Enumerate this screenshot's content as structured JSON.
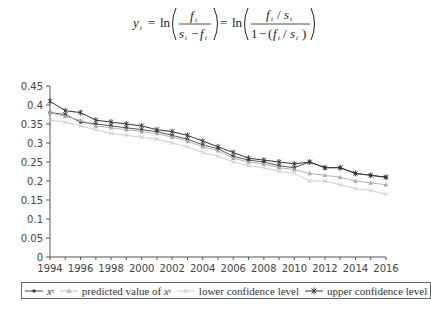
{
  "formula": {
    "lhs": "y",
    "lhs_sub": "t",
    "eq1_num": "f",
    "eq1_den_a": "s",
    "eq1_den_b": "f",
    "eq2_num_a": "f",
    "eq2_num_b": "s",
    "eq2_den_one": "1",
    "sub": "t",
    "ln": "ln",
    "text": "y_t = ln( f_t / (s_t − f_t) ) = ln( (f_t / s_t) / (1 − (f_t / s_t)) )"
  },
  "legend": {
    "items": [
      {
        "label": "x",
        "sub": "t",
        "italic": true
      },
      {
        "label": "predicted value of ",
        "var": "x",
        "sub": "t"
      },
      {
        "label": "lower confidence level"
      },
      {
        "label": "upper confidence level"
      }
    ]
  },
  "chart_data": {
    "type": "line",
    "title": "",
    "xlabel": "",
    "ylabel": "",
    "x": [
      1994,
      1995,
      1996,
      1997,
      1998,
      1999,
      2000,
      2001,
      2002,
      2003,
      2004,
      2005,
      2006,
      2007,
      2008,
      2009,
      2010,
      2011,
      2012,
      2013,
      2014,
      2015,
      2016
    ],
    "x_ticks": [
      "1994",
      "1996",
      "1998",
      "2000",
      "2002",
      "2004",
      "2006",
      "2008",
      "2010",
      "2012",
      "2014",
      "2016"
    ],
    "y_ticks": [
      "0",
      "0.05",
      "0.1",
      "0.15",
      "0.2",
      "0.25",
      "0.3",
      "0.35",
      "0.4",
      "0.45"
    ],
    "ylim": [
      0,
      0.45
    ],
    "xlim": [
      1994,
      2016
    ],
    "grid": false,
    "legend_position": "bottom",
    "series": [
      {
        "name": "x_t",
        "color": "#444444",
        "marker": "dot",
        "values": [
          0.38,
          0.375,
          0.355,
          0.35,
          0.345,
          0.34,
          0.335,
          0.33,
          0.32,
          0.31,
          0.295,
          0.285,
          0.265,
          0.255,
          0.25,
          0.24,
          0.235,
          0.25,
          0.235,
          0.235,
          0.22,
          0.215,
          0.21
        ]
      },
      {
        "name": "predicted value of x_t",
        "color": "#aaaaaa",
        "marker": "triangle",
        "values": [
          0.38,
          0.37,
          0.36,
          0.345,
          0.34,
          0.335,
          0.33,
          0.325,
          0.315,
          0.305,
          0.29,
          0.28,
          0.26,
          0.25,
          0.245,
          0.235,
          0.23,
          0.22,
          0.215,
          0.21,
          0.2,
          0.195,
          0.19
        ]
      },
      {
        "name": "lower confidence level",
        "color": "#c8c8c8",
        "marker": "cross",
        "values": [
          0.36,
          0.355,
          0.345,
          0.335,
          0.325,
          0.32,
          0.315,
          0.31,
          0.3,
          0.29,
          0.275,
          0.265,
          0.25,
          0.24,
          0.235,
          0.225,
          0.22,
          0.2,
          0.2,
          0.19,
          0.18,
          0.175,
          0.165
        ]
      },
      {
        "name": "upper confidence level",
        "color": "#333333",
        "marker": "star",
        "values": [
          0.41,
          0.385,
          0.38,
          0.36,
          0.355,
          0.35,
          0.345,
          0.335,
          0.33,
          0.32,
          0.305,
          0.29,
          0.275,
          0.26,
          0.255,
          0.25,
          0.245,
          0.25,
          0.235,
          0.235,
          0.22,
          0.215,
          0.21
        ]
      }
    ]
  }
}
